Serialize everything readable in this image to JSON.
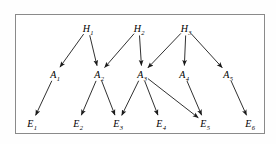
{
  "figure": {
    "type": "directed-acyclic-graph",
    "background_color": "#ffffff",
    "border_color": "#8a8a8a",
    "edge_color": "#1a1a1a",
    "label_color": "#000000",
    "width": 276,
    "height": 144
  },
  "nodes": [
    {
      "id": "H1",
      "base": "H",
      "sub": "1",
      "layer": "hypothesis",
      "x": 88,
      "y": 28
    },
    {
      "id": "H2",
      "base": "H",
      "sub": "2",
      "layer": "hypothesis",
      "x": 139,
      "y": 28
    },
    {
      "id": "H3",
      "base": "H",
      "sub": "3",
      "layer": "hypothesis",
      "x": 186,
      "y": 28
    },
    {
      "id": "A1",
      "base": "A",
      "sub": "1",
      "layer": "intermediate",
      "x": 55,
      "y": 74
    },
    {
      "id": "A2",
      "base": "A",
      "sub": "2",
      "layer": "intermediate",
      "x": 99,
      "y": 74
    },
    {
      "id": "A3",
      "base": "A",
      "sub": "3",
      "layer": "intermediate",
      "x": 142,
      "y": 74
    },
    {
      "id": "A4",
      "base": "A",
      "sub": "4",
      "layer": "intermediate",
      "x": 184,
      "y": 74
    },
    {
      "id": "A5",
      "base": "A",
      "sub": "5",
      "layer": "intermediate",
      "x": 228,
      "y": 74
    },
    {
      "id": "E1",
      "base": "E",
      "sub": "1",
      "layer": "evidence",
      "x": 32,
      "y": 123
    },
    {
      "id": "E2",
      "base": "E",
      "sub": "2",
      "layer": "evidence",
      "x": 78,
      "y": 123
    },
    {
      "id": "E3",
      "base": "E",
      "sub": "3",
      "layer": "evidence",
      "x": 118,
      "y": 123
    },
    {
      "id": "E4",
      "base": "E",
      "sub": "4",
      "layer": "evidence",
      "x": 161,
      "y": 123
    },
    {
      "id": "E5",
      "base": "E",
      "sub": "5",
      "layer": "evidence",
      "x": 205,
      "y": 123
    },
    {
      "id": "E6",
      "base": "E",
      "sub": "6",
      "layer": "evidence",
      "x": 250,
      "y": 123
    }
  ],
  "edges": [
    {
      "from": "H1",
      "to": "A1"
    },
    {
      "from": "H1",
      "to": "A2"
    },
    {
      "from": "H2",
      "to": "A2"
    },
    {
      "from": "H2",
      "to": "A3"
    },
    {
      "from": "H3",
      "to": "A3"
    },
    {
      "from": "H3",
      "to": "A4"
    },
    {
      "from": "H3",
      "to": "A5"
    },
    {
      "from": "A1",
      "to": "E1"
    },
    {
      "from": "A2",
      "to": "E2"
    },
    {
      "from": "A2",
      "to": "E3"
    },
    {
      "from": "A3",
      "to": "E3"
    },
    {
      "from": "A3",
      "to": "E4"
    },
    {
      "from": "A3",
      "to": "E5"
    },
    {
      "from": "A4",
      "to": "E5"
    },
    {
      "from": "A5",
      "to": "E6"
    }
  ]
}
